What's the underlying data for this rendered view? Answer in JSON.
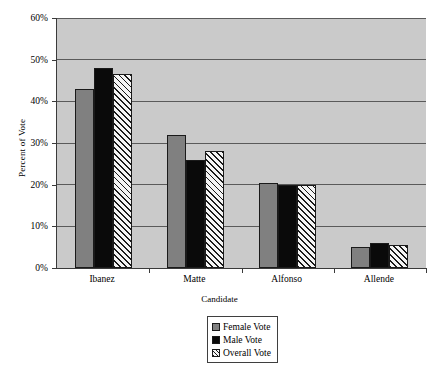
{
  "chart_data": {
    "type": "bar",
    "title": "",
    "xlabel": "Candidate",
    "ylabel": "Percent of Vote",
    "categories": [
      "Ibanez",
      "Matte",
      "Alfonso",
      "Allende"
    ],
    "series": [
      {
        "name": "Female Vote",
        "color": "#808080",
        "values": [
          43,
          32,
          20.5,
          5
        ]
      },
      {
        "name": "Male Vote",
        "color": "#0a0a0a",
        "values": [
          48,
          26,
          20,
          6
        ]
      },
      {
        "name": "Overall Vote",
        "color": "#f2f2f2",
        "values": [
          46.5,
          28,
          20,
          5.5
        ]
      }
    ],
    "ylim": [
      0,
      60
    ],
    "yticks": [
      "0%",
      "10%",
      "20%",
      "30%",
      "40%",
      "50%",
      "60%"
    ],
    "ytick_values": [
      0,
      10,
      20,
      30,
      40,
      50,
      60
    ],
    "grid": true,
    "legend_position": "bottom-center",
    "plot_background": "#cacaca",
    "figure_background": "#ffffff"
  }
}
